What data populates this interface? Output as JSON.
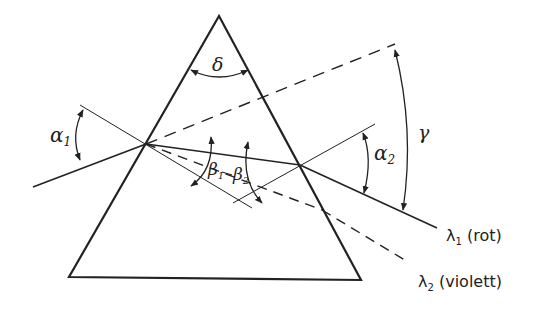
{
  "diagram": {
    "labels": {
      "apex_angle": "δ",
      "incidence_angle": "α",
      "incidence_sub": "1",
      "exit_angle": "α",
      "exit_sub": "2",
      "deviation_angle": "γ",
      "refraction_1": "β",
      "refraction_1_sub": "1",
      "refraction_2": "β",
      "refraction_2_sub": "2",
      "ray_red": "λ",
      "ray_red_sub": "1",
      "ray_red_name": " (rot)",
      "ray_violet": "λ",
      "ray_violet_sub": "2",
      "ray_violet_name": " (violett)"
    },
    "colors": {
      "ink": "#222222",
      "background": "#ffffff"
    }
  }
}
